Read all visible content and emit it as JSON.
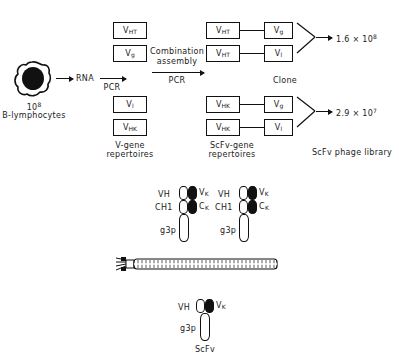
{
  "figure": {
    "type": "flow-diagram"
  },
  "source": {
    "cell_label_line1": "10",
    "cell_label_exp": "8",
    "cell_label_line2": "B-lymphocytes",
    "cell_icon": "b-lymphocyte-cell-icon"
  },
  "steps": {
    "rna_label": "RNA",
    "pcr_first": "PCR",
    "pcr_second": "PCR",
    "combination_line1": "Combination",
    "combination_line2": "assembly"
  },
  "v_gene": {
    "caption_line1": "V-gene",
    "caption_line2": "repertoires",
    "boxes": [
      {
        "main": "V",
        "sub": "HT"
      },
      {
        "main": "V",
        "sub": "g"
      },
      {
        "main": "V",
        "sub": "l"
      },
      {
        "main": "V",
        "sub": "HK"
      }
    ]
  },
  "scfv_gene": {
    "caption_line1": "ScFv-gene",
    "caption_line2": "repertoires",
    "clone_label": "Clone",
    "clones_label": "Clones",
    "pairs": [
      {
        "left_main": "V",
        "left_sub": "HT",
        "right_main": "V",
        "right_sub": "g"
      },
      {
        "left_main": "V",
        "left_sub": "HT",
        "right_main": "V",
        "right_sub": "l"
      },
      {
        "left_main": "V",
        "left_sub": "HK",
        "right_main": "V",
        "right_sub": "g"
      },
      {
        "left_main": "V",
        "left_sub": "HK",
        "right_main": "V",
        "right_sub": "l"
      }
    ]
  },
  "output": {
    "count_top_mantissa": "1.6 × 10",
    "count_top_exp": "8",
    "count_bottom_mantissa": "2.9 × 10",
    "count_bottom_exp": "7",
    "library_label": "ScFv phage library"
  },
  "fab_display": {
    "left": {
      "vh_label": "VH",
      "ch1_label": "CH1",
      "vk_main": "V",
      "vk_sub": "K",
      "ck_main": "C",
      "ck_sub": "K",
      "g3p_label": "g3p"
    },
    "right": {
      "vh_label": "VH",
      "ch1_label": "CH1",
      "vk_main": "V",
      "vk_sub": "K",
      "ck_main": "C",
      "ck_sub": "K",
      "g3p_label": "g3p"
    }
  },
  "phage_particle": {
    "icon": "filamentous-phage-particle-icon"
  },
  "scfv_display": {
    "vh_label": "VH",
    "vk_main": "V",
    "vk_sub": "K",
    "g3p_label": "g3p",
    "name_label": "ScFv"
  },
  "colors": {
    "ink": "#1a1a1a",
    "stroke": "#111111",
    "background": "#ffffff"
  }
}
